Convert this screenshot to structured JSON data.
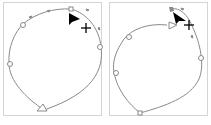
{
  "figure": {
    "panels": [
      {
        "id": "left",
        "description": "Closed path with anchor points; pen cursor near top-right, direction arrow at bottom",
        "stroke_color": "#8a8a8a",
        "anchor_fill": "#ffffff",
        "cursor_color": "#000000",
        "icons": [
          "arrow-cursor-icon",
          "crosshair-icon",
          "direction-arrow-icon"
        ]
      },
      {
        "id": "right",
        "description": "Closed path with anchor points; pen cursor near top-right, direction arrow at top",
        "stroke_color": "#8a8a8a",
        "anchor_fill": "#ffffff",
        "cursor_color": "#000000",
        "icons": [
          "arrow-cursor-icon",
          "crosshair-icon",
          "direction-arrow-icon"
        ]
      }
    ],
    "border_color": "#d4d4d4"
  }
}
